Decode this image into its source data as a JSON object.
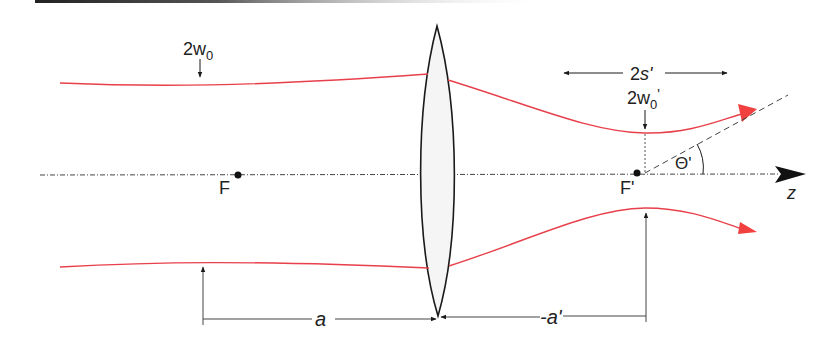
{
  "diagram": {
    "colors": {
      "beam": "#e8404a",
      "beam_arrow": "#f0403f",
      "ink": "#1a1a1a",
      "lens_fill": "#f6f5f5",
      "axis": "#333333"
    },
    "labels": {
      "input_waist": "2w",
      "input_waist_sub": "0",
      "focal_point_front": "F",
      "focal_point_back": "F'",
      "axis": "z",
      "rayleigh_range": "2s'",
      "output_waist": "2w",
      "output_waist_sub": "0",
      "output_waist_prime": "'",
      "divergence_angle": "Θ'",
      "object_distance": "a",
      "image_distance": "-a'"
    },
    "elements": {
      "lens": "thin biconvex lens",
      "optical_axis": "dash-dot line with arrow",
      "beam_envelope": [
        "upper",
        "lower"
      ]
    }
  }
}
